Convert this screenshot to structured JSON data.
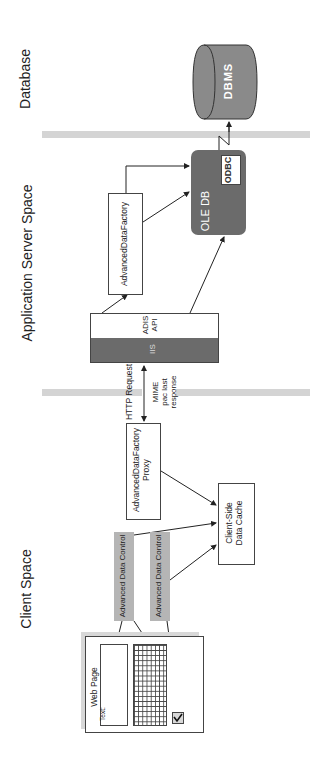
{
  "zones": {
    "database": "Database",
    "app_server": "Application Server Space",
    "client": "Client Space"
  },
  "database": {
    "dbms_label": "DBMS"
  },
  "app_server": {
    "ole_db_label": "OLE DB",
    "odbc_label": "ODBC",
    "factory_label": "AdvancedDataFactory",
    "adis_line1": "ADIS",
    "adis_line2": "API",
    "iis_label": "IIS"
  },
  "connection": {
    "request_label": "HTTP Request",
    "response_line1": "MIME",
    "response_line2": "pac last",
    "response_line3": "response"
  },
  "client": {
    "proxy_line1": "AdvancedDataFactory",
    "proxy_line2": "Proxy",
    "cache_line1": "Client-Side",
    "cache_line2": "Data Cache",
    "adc1_label": "Advanced Data Control",
    "adc2_label": "Advanced Data Control",
    "webpage_label": "Web Page",
    "text_field_label": "Text:"
  },
  "colors": {
    "dark_fill": "#6b6b6b",
    "separator": "#d4d4d4",
    "adc_fill": "#b5b5b5"
  }
}
